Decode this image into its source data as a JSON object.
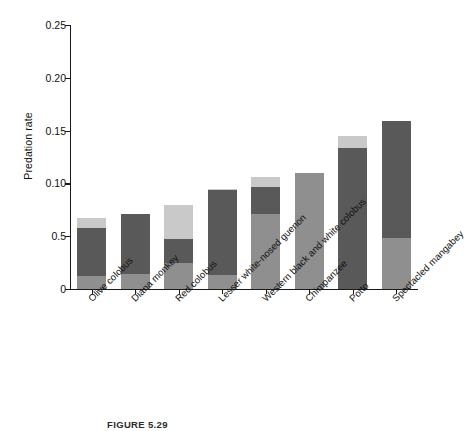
{
  "chart_data": {
    "type": "bar",
    "subtype": "stacked-bar",
    "title": "",
    "xlabel": "",
    "ylabel": "Predation rate",
    "ylim": [
      0,
      0.25
    ],
    "grid": false,
    "legend": "none",
    "categories": [
      "Olive colobus",
      "Diana monkey",
      "Red colobus",
      "Lesser white-nosed guenon",
      "Western black and white colobus",
      "Chimpanzee",
      "Potto",
      "Spectacled mangabey"
    ],
    "ytick_labels": [
      "0.25",
      "0.20",
      "0.15",
      "0.10",
      "0.5",
      "0"
    ],
    "ytick_values": [
      0.25,
      0.2,
      0.15,
      0.1,
      0.05,
      0
    ],
    "series": [
      {
        "name": "lower-segment",
        "color": "#8f8f8f",
        "values": [
          0.012,
          0.014,
          0.025,
          0.013,
          0.071,
          0.11,
          0.0,
          0.048
        ]
      },
      {
        "name": "middle-segment",
        "color": "#595959",
        "values": [
          0.046,
          0.057,
          0.022,
          0.081,
          0.026,
          0.0,
          0.134,
          0.111
        ]
      },
      {
        "name": "upper-segment",
        "color": "#c9c9c9",
        "values": [
          0.009,
          0.0,
          0.033,
          0.001,
          0.009,
          0.0,
          0.011,
          0.0
        ]
      }
    ],
    "totals": [
      0.067,
      0.071,
      0.08,
      0.095,
      0.106,
      0.11,
      0.145,
      0.159
    ]
  },
  "caption": {
    "text": "FIGURE 5.29"
  },
  "colors": {
    "axis": "#1a1a1a",
    "background": "#ffffff",
    "segment_light": "#c9c9c9",
    "segment_medium": "#8f8f8f",
    "segment_dark": "#595959"
  }
}
